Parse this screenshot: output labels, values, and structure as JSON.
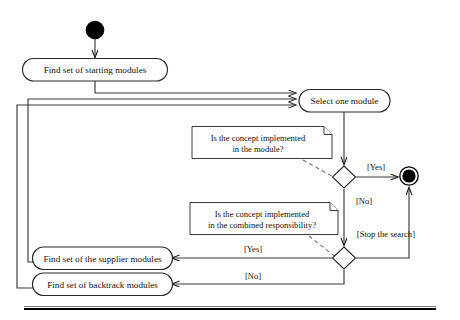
{
  "figure": {
    "kind": "uml-activity-diagram",
    "colors": {
      "line": "#3a3a3a",
      "node_stroke": "#2b2b2b",
      "note_stroke": "#3a3a3a",
      "fill": "#ffffff",
      "terminal": "#000000",
      "dashed_link": "#6e6e6e"
    }
  },
  "nodes": {
    "start": {
      "type": "initial-node",
      "label": ""
    },
    "find_starting": {
      "type": "action",
      "label": "Find set of starting modules"
    },
    "select_module": {
      "type": "action",
      "label": "Select one module"
    },
    "find_supplier": {
      "type": "action",
      "label": "Find set of the supplier modules"
    },
    "find_backtrack": {
      "type": "action",
      "label": "Find set of backtrack modules"
    },
    "decision_1": {
      "type": "decision",
      "label": ""
    },
    "decision_2": {
      "type": "decision",
      "label": ""
    },
    "final": {
      "type": "final-node",
      "label": ""
    }
  },
  "notes": {
    "note_1": {
      "line1": "Is the concept implemented",
      "line2": "in the module?"
    },
    "note_2": {
      "line1": "Is the concept implemented",
      "line2": "in the combined responsibility?"
    }
  },
  "edge_labels": {
    "yes_1": "[Yes]",
    "no_1": "[No]",
    "stop": "[Stop the search]",
    "yes_2": "[Yes]",
    "no_2": "[No]"
  }
}
